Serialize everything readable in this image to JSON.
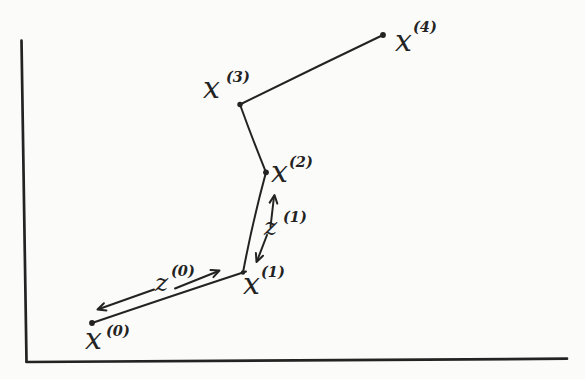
{
  "canvas": {
    "width_px": 585,
    "height_px": 379,
    "ink_color": "#232323",
    "paper_color": "#fbfbf9"
  },
  "figure": {
    "description_style": "hand-drawn sketch of an iterative search path inside an L-shaped pair of axes",
    "points": [
      {
        "id": "x0",
        "base": "x",
        "sup": "(0)"
      },
      {
        "id": "x1",
        "base": "x",
        "sup": "(1)"
      },
      {
        "id": "x2",
        "base": "x",
        "sup": "(2)"
      },
      {
        "id": "x3",
        "base": "x",
        "sup": "(3)"
      },
      {
        "id": "x4",
        "base": "x",
        "sup": "(4)"
      }
    ],
    "directions": [
      {
        "id": "z0",
        "base": "z",
        "sup": "(0)"
      },
      {
        "id": "z1",
        "base": "z",
        "sup": "(1)"
      }
    ],
    "path_points_px": [
      {
        "id": "x0",
        "x": 92,
        "y": 323
      },
      {
        "id": "x1",
        "x": 243,
        "y": 272.5
      },
      {
        "id": "x2",
        "x": 266,
        "y": 172.3
      },
      {
        "id": "x3",
        "x": 240,
        "y": 104.5
      },
      {
        "id": "x4",
        "x": 383,
        "y": 35
      }
    ]
  }
}
